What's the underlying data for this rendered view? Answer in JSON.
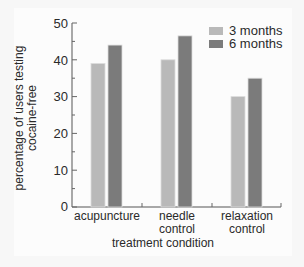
{
  "chart_data": {
    "type": "bar",
    "title": "",
    "xlabel": "treatment condition",
    "ylabel": "percentage of users testing cocaine-free",
    "ylabel_lines": [
      "percentage of users testing",
      "cocaine-free"
    ],
    "categories": [
      "acupuncture",
      "needle control",
      "relaxation control"
    ],
    "category_lines": [
      [
        "acupuncture"
      ],
      [
        "needle",
        "control"
      ],
      [
        "relaxation",
        "control"
      ]
    ],
    "series": [
      {
        "name": "3 months",
        "color": "#b9b9b9",
        "values": [
          39,
          40,
          30
        ]
      },
      {
        "name": "6 months",
        "color": "#7b7b7b",
        "values": [
          44,
          46.5,
          35
        ]
      }
    ],
    "ylim": [
      0,
      50
    ],
    "yticks": [
      0,
      10,
      20,
      30,
      40,
      50
    ],
    "grid": false,
    "legend_position": "top-right"
  },
  "labels": {
    "xtitle": "treatment condition",
    "ylabel_line1": "percentage of users testing",
    "ylabel_line2": "cocaine-free",
    "legend_3": "3 months",
    "legend_6": "6 months",
    "cat1_l1": "acupuncture",
    "cat2_l1": "needle",
    "cat2_l2": "control",
    "cat3_l1": "relaxation",
    "cat3_l2": "control",
    "tick0": "0",
    "tick10": "10",
    "tick20": "20",
    "tick30": "30",
    "tick40": "40",
    "tick50": "50"
  }
}
